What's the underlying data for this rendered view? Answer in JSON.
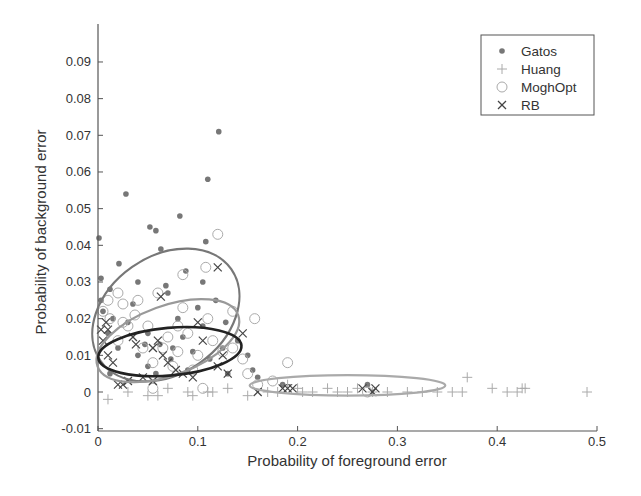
{
  "chart_data": {
    "type": "scatter",
    "title": "",
    "xlabel": "Probability of foreground error",
    "ylabel": "Probability of background error",
    "xlim": [
      0,
      0.5
    ],
    "ylim": [
      -0.01,
      0.095
    ],
    "xticks": [
      0,
      0.1,
      0.2,
      0.3,
      0.4,
      0.5
    ],
    "xtick_labels": [
      "0",
      "0.1",
      "0.2",
      "0.3",
      "0.4",
      "0.5"
    ],
    "yticks": [
      -0.01,
      0,
      0.01,
      0.02,
      0.03,
      0.04,
      0.05,
      0.06,
      0.07,
      0.08,
      0.09
    ],
    "ytick_labels": [
      "-0.01",
      "0",
      "0.01",
      "0.02",
      "0.03",
      "0.04",
      "0.05",
      "0.06",
      "0.07",
      "0.08",
      "0.09"
    ],
    "grid": false,
    "legend_position": "upper right",
    "series": [
      {
        "name": "Gatos",
        "marker": "dot",
        "color": "#777777",
        "points": [
          [
            0.001,
            0.042
          ],
          [
            0.003,
            0.031
          ],
          [
            0.028,
            0.054
          ],
          [
            0.052,
            0.045
          ],
          [
            0.058,
            0.044
          ],
          [
            0.082,
            0.048
          ],
          [
            0.108,
            0.041
          ],
          [
            0.11,
            0.058
          ],
          [
            0.121,
            0.071
          ],
          [
            0.063,
            0.039
          ],
          [
            0.021,
            0.035
          ],
          [
            0.003,
            0.025
          ],
          [
            0.005,
            0.022
          ],
          [
            0.012,
            0.028
          ],
          [
            0.04,
            0.03
          ],
          [
            0.068,
            0.029
          ],
          [
            0.07,
            0.027
          ],
          [
            0.088,
            0.033
          ],
          [
            0.1,
            0.023
          ],
          [
            0.118,
            0.025
          ],
          [
            0.03,
            0.019
          ],
          [
            0.05,
            0.016
          ],
          [
            0.062,
            0.013
          ],
          [
            0.075,
            0.012
          ],
          [
            0.085,
            0.015
          ],
          [
            0.095,
            0.011
          ],
          [
            0.105,
            0.018
          ],
          [
            0.112,
            0.009
          ],
          [
            0.125,
            0.012
          ],
          [
            0.14,
            0.014
          ],
          [
            0.02,
            0.012
          ],
          [
            0.04,
            0.01
          ],
          [
            0.05,
            0.007
          ],
          [
            0.058,
            0.005
          ],
          [
            0.09,
            0.006
          ],
          [
            0.13,
            0.005
          ],
          [
            0.155,
            0.006
          ],
          [
            0.16,
            0.004
          ],
          [
            0.185,
            0.002
          ],
          [
            0.27,
            0.002
          ],
          [
            0.01,
            0.016
          ],
          [
            0.015,
            0.02
          ],
          [
            0.035,
            0.024
          ],
          [
            0.08,
            0.02
          ],
          [
            0.105,
            0.03
          ],
          [
            0.15,
            0.01
          ],
          [
            0.012,
            0.005
          ],
          [
            0.073,
            0.009
          ],
          [
            0.047,
            0.013
          ],
          [
            0.128,
            0.019
          ]
        ]
      },
      {
        "name": "Huang",
        "marker": "plus",
        "color": "#aaaaaa",
        "points": [
          [
            0.01,
            -0.002
          ],
          [
            0.03,
            0.0
          ],
          [
            0.05,
            -0.001
          ],
          [
            0.07,
            0.001
          ],
          [
            0.09,
            0.0
          ],
          [
            0.11,
            0.0
          ],
          [
            0.13,
            0.001
          ],
          [
            0.15,
            -0.001
          ],
          [
            0.17,
            0.0
          ],
          [
            0.18,
            0.0
          ],
          [
            0.2,
            0.001
          ],
          [
            0.215,
            0.0
          ],
          [
            0.23,
            0.001
          ],
          [
            0.24,
            0.0
          ],
          [
            0.25,
            0.0
          ],
          [
            0.26,
            0.001
          ],
          [
            0.275,
            0.0
          ],
          [
            0.29,
            0.0
          ],
          [
            0.31,
            0.0
          ],
          [
            0.325,
            0.0
          ],
          [
            0.34,
            0.0
          ],
          [
            0.355,
            0.0
          ],
          [
            0.365,
            0.0
          ],
          [
            0.37,
            0.004
          ],
          [
            0.395,
            0.001
          ],
          [
            0.41,
            0.0
          ],
          [
            0.42,
            0.0
          ],
          [
            0.425,
            0.001
          ],
          [
            0.428,
            0.001
          ],
          [
            0.49,
            0.0
          ],
          [
            0.06,
            -0.001
          ],
          [
            0.095,
            -0.001
          ],
          [
            0.115,
            0.0
          ],
          [
            0.19,
            0.002
          ],
          [
            0.205,
            0.0
          ]
        ]
      },
      {
        "name": "MoghOpt",
        "marker": "circle",
        "color": "#aaaaaa",
        "points": [
          [
            0.12,
            0.043
          ],
          [
            0.108,
            0.034
          ],
          [
            0.085,
            0.032
          ],
          [
            0.06,
            0.027
          ],
          [
            0.02,
            0.027
          ],
          [
            0.01,
            0.025
          ],
          [
            0.005,
            0.022
          ],
          [
            0.025,
            0.024
          ],
          [
            0.04,
            0.025
          ],
          [
            0.085,
            0.023
          ],
          [
            0.11,
            0.02
          ],
          [
            0.157,
            0.02
          ],
          [
            0.135,
            0.022
          ],
          [
            0.012,
            0.02
          ],
          [
            0.03,
            0.018
          ],
          [
            0.05,
            0.018
          ],
          [
            0.07,
            0.015
          ],
          [
            0.09,
            0.016
          ],
          [
            0.115,
            0.014
          ],
          [
            0.135,
            0.012
          ],
          [
            0.02,
            0.014
          ],
          [
            0.045,
            0.012
          ],
          [
            0.065,
            0.012
          ],
          [
            0.08,
            0.011
          ],
          [
            0.1,
            0.01
          ],
          [
            0.125,
            0.011
          ],
          [
            0.145,
            0.009
          ],
          [
            0.055,
            0.008
          ],
          [
            0.075,
            0.007
          ],
          [
            0.095,
            0.006
          ],
          [
            0.15,
            0.005
          ],
          [
            0.175,
            0.003
          ],
          [
            0.19,
            0.008
          ],
          [
            0.055,
            0.001
          ],
          [
            0.105,
            0.001
          ],
          [
            0.16,
            0.002
          ],
          [
            0.27,
            0.0
          ],
          [
            0.025,
            0.019
          ],
          [
            0.08,
            0.018
          ],
          [
            0.037,
            0.021
          ]
        ]
      },
      {
        "name": "RB",
        "marker": "x",
        "color": "#444444",
        "points": [
          [
            0.12,
            0.034
          ],
          [
            0.063,
            0.026
          ],
          [
            0.003,
            0.017
          ],
          [
            0.008,
            0.019
          ],
          [
            0.01,
            0.01
          ],
          [
            0.035,
            0.015
          ],
          [
            0.038,
            0.013
          ],
          [
            0.055,
            0.012
          ],
          [
            0.06,
            0.014
          ],
          [
            0.1,
            0.019
          ],
          [
            0.07,
            0.008
          ],
          [
            0.105,
            0.014
          ],
          [
            0.145,
            0.016
          ],
          [
            0.085,
            0.005
          ],
          [
            0.12,
            0.007
          ],
          [
            0.13,
            0.005
          ],
          [
            0.125,
            0.01
          ],
          [
            0.02,
            0.002
          ],
          [
            0.025,
            0.002
          ],
          [
            0.03,
            0.003
          ],
          [
            0.045,
            0.004
          ],
          [
            0.055,
            0.003
          ],
          [
            0.095,
            0.004
          ],
          [
            0.078,
            0.006
          ],
          [
            0.015,
            0.008
          ],
          [
            0.005,
            0.014
          ],
          [
            0.16,
            0.0
          ],
          [
            0.185,
            0.001
          ],
          [
            0.19,
            0.001
          ],
          [
            0.195,
            0.001
          ],
          [
            0.265,
            0.001
          ],
          [
            0.275,
            0.0
          ],
          [
            0.278,
            0.001
          ],
          [
            0.01,
            0.017
          ],
          [
            0.065,
            0.01
          ]
        ]
      }
    ],
    "ellipses": [
      {
        "series": "Gatos",
        "cx": 0.068,
        "cy": 0.021,
        "rx": 0.08,
        "ry": 0.016,
        "angle": -35,
        "color": "#777777",
        "width": 2.2
      },
      {
        "series": "MoghOpt",
        "cx": 0.07,
        "cy": 0.014,
        "rx": 0.075,
        "ry": 0.0095,
        "angle": -20,
        "color": "#999999",
        "width": 2.2
      },
      {
        "series": "RB",
        "cx": 0.072,
        "cy": 0.011,
        "rx": 0.072,
        "ry": 0.0065,
        "angle": -5,
        "color": "#222222",
        "width": 2.6
      },
      {
        "series": "Huang",
        "cx": 0.25,
        "cy": 0.0018,
        "rx": 0.098,
        "ry": 0.0028,
        "angle": 0,
        "color": "#aaaaaa",
        "width": 2.2
      }
    ]
  },
  "legend": {
    "items": [
      {
        "label": "Gatos",
        "marker": "dot"
      },
      {
        "label": "Huang",
        "marker": "plus"
      },
      {
        "label": "MoghOpt",
        "marker": "circle"
      },
      {
        "label": "RB",
        "marker": "x"
      }
    ]
  },
  "axes": {
    "xlabel": "Probability of foreground error",
    "ylabel": "Probability of background error"
  }
}
